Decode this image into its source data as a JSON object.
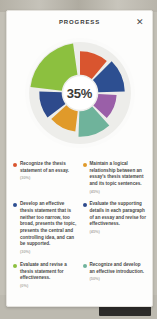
{
  "window": {
    "title": "PROGRESS",
    "close_icon": "close-icon",
    "close_glyph": "✕"
  },
  "chart_data": {
    "type": "pie",
    "title": "PROGRESS",
    "center_label": "35%",
    "center_value": 35,
    "legend_position": "bottom",
    "grid": false,
    "categories": [
      "Recognize the thesis statement of an essay.",
      "Maintain a logical relationship between an essay's thesis statement and its topic sentences.",
      "Develop an effective thesis statement that is neither too narrow, too broad, presents the topic, presents the central and controlling idea, and can be supported.",
      "Evaluate the supporting details in each paragraph of an essay and revise for effectiveness.",
      "Evaluate and revise a thesis statement for effectiveness.",
      "Recognize and develop an effective introduction."
    ],
    "values": [
      40,
      35,
      60,
      30,
      45,
      30
    ],
    "colors": [
      "#d9552f",
      "#e09a2a",
      "#2e4a8c",
      "#4d3f8f",
      "#8cc03f",
      "#6fb39b",
      "#9a5fa8",
      "#2d4f91"
    ],
    "segments": [
      {
        "name": "segment-orange-red",
        "color": "#d9552f",
        "start": 0,
        "end": 40,
        "radius": 82
      },
      {
        "name": "segment-navy",
        "color": "#2d4f91",
        "start": 45,
        "end": 88,
        "radius": 88
      },
      {
        "name": "segment-purple",
        "color": "#9a5fa8",
        "start": 93,
        "end": 133,
        "radius": 72
      },
      {
        "name": "segment-teal",
        "color": "#6fb39b",
        "start": 138,
        "end": 182,
        "radius": 86
      },
      {
        "name": "segment-amber",
        "color": "#e09a2a",
        "start": 187,
        "end": 228,
        "radius": 76
      },
      {
        "name": "segment-indigo",
        "color": "#2e4a8c",
        "start": 233,
        "end": 272,
        "radius": 80
      },
      {
        "name": "segment-green",
        "color": "#8cc03f",
        "start": 277,
        "end": 352,
        "radius": 98
      }
    ]
  },
  "legend": {
    "items": [
      {
        "id": "recognize-thesis-statement",
        "color": "#d9552f",
        "label": "Recognize the thesis statement of an essay.",
        "percent": "(30%)"
      },
      {
        "id": "maintain-logical-relationship",
        "color": "#e09a2a",
        "label": "Maintain a logical relationship between an essay's thesis statement and its topic sentences.",
        "percent": "(45%)"
      },
      {
        "id": "develop-effective-thesis",
        "color": "#2d4f91",
        "label": "Develop an effective thesis statement that is neither too narrow, too broad, presents the topic, presents the central and controlling idea, and can be supported.",
        "percent": "(30%)"
      },
      {
        "id": "evaluate-supporting-details",
        "color": "#2e4a8c",
        "label": "Evaluate the supporting details in each paragraph of an essay and revise for effectiveness.",
        "percent": "(45%)"
      },
      {
        "id": "evaluate-revise-thesis",
        "color": "#8cc03f",
        "label": "Evaluate and revise a thesis statement for effectiveness.",
        "percent": "(0%)"
      },
      {
        "id": "recognize-develop-introduction",
        "color": "#6fb39b",
        "label": "Recognize and develop an effective introduction.",
        "percent": "(50%)"
      }
    ]
  }
}
